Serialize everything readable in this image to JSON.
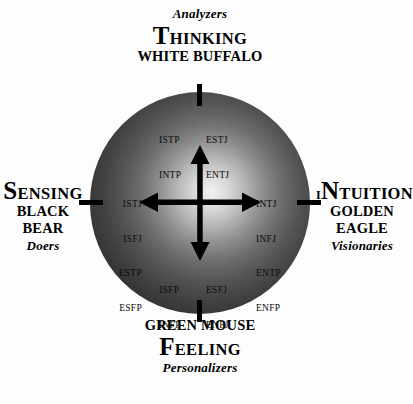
{
  "diagram": {
    "background_color": "#fdfdfd",
    "sphere_color_light": "#f2f2f2",
    "sphere_color_dark": "#141414",
    "axis_color": "#000000"
  },
  "poles": {
    "top": {
      "tagline": "Analyzers",
      "function_lead": "T",
      "function_rest": "HINKING",
      "animal": "WHITE BUFFALO"
    },
    "bottom": {
      "animal": "GREEN MOUSE",
      "function_lead": "F",
      "function_rest": "EELING",
      "tagline": "Personalizers"
    },
    "left": {
      "function_lead": "S",
      "function_rest": "ENSING",
      "animal_line1": "BLACK",
      "animal_line2": "BEAR",
      "tagline": "Doers"
    },
    "right": {
      "function_prefix": "I",
      "function_lead": "N",
      "function_rest": "TUITION",
      "animal_line1": "GOLDEN",
      "animal_line2": "EAGLE",
      "tagline": "Visionaries"
    }
  },
  "quadrant_types": {
    "top_left": [
      "ISTP",
      "INTP"
    ],
    "top_right": [
      "ESTJ",
      "ENTJ"
    ],
    "left": [
      "ISTJ",
      "ISFJ",
      "ESTP",
      "ESFP"
    ],
    "right": [
      "INTJ",
      "INFJ",
      "ENTP",
      "ENFP"
    ],
    "bottom_left": [
      "ISFP",
      "INFP"
    ],
    "bottom_right": [
      "ESFJ",
      "ENFJ"
    ]
  },
  "axes": {
    "horizontal_label_left": "Sensing",
    "horizontal_label_right": "Intuition",
    "vertical_label_top": "Thinking",
    "vertical_label_bottom": "Feeling"
  }
}
